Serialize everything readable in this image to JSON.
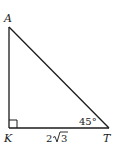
{
  "diagram": {
    "type": "right-triangle",
    "vertices": {
      "A": {
        "label": "A"
      },
      "K": {
        "label": "K"
      },
      "T": {
        "label": "T"
      }
    },
    "right_angle_at": "K",
    "angle_T": {
      "label": "45°",
      "value": 45
    },
    "side_KT": {
      "label_prefix": "2",
      "label_radicand": "3",
      "label": "2√3"
    },
    "colors": {
      "stroke": "#1a1a1a",
      "background": "#ffffff"
    }
  }
}
